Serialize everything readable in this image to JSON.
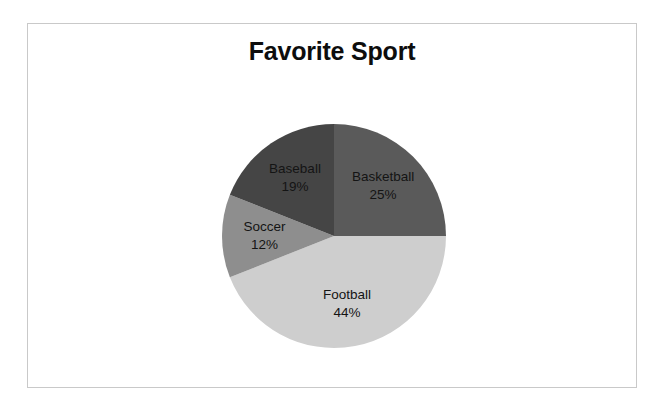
{
  "chart": {
    "title": "Favorite Sport"
  },
  "chart_data": {
    "type": "pie",
    "title": "Favorite Sport",
    "xlabel": "",
    "ylabel": "",
    "legend": "none",
    "grid": false,
    "start_angle_deg": 0,
    "direction": "clockwise",
    "value_unit": "percent",
    "categories": [
      "Basketball",
      "Football",
      "Soccer",
      "Baseball"
    ],
    "values": [
      25,
      44,
      12,
      19
    ],
    "labels": [
      "Basketball",
      "Football",
      "Soccer",
      "Baseball"
    ],
    "value_labels": [
      "25%",
      "44%",
      "12%",
      "19%"
    ],
    "colors": [
      "#5a5a5a",
      "#cecece",
      "#8e8e8e",
      "#454545"
    ],
    "slices": [
      {
        "label": "Basketball",
        "value": 25,
        "value_label": "25%",
        "color": "#5a5a5a"
      },
      {
        "label": "Football",
        "value": 44,
        "value_label": "44%",
        "color": "#cecece"
      },
      {
        "label": "Soccer",
        "value": 12,
        "value_label": "12%",
        "color": "#8e8e8e"
      },
      {
        "label": "Baseball",
        "value": 19,
        "value_label": "19%",
        "color": "#454545"
      }
    ]
  },
  "style": {
    "frame_border_color": "#c9c9c9",
    "background_color": "#ffffff",
    "title_color": "#0d0d0d",
    "label_color": "#141414"
  }
}
